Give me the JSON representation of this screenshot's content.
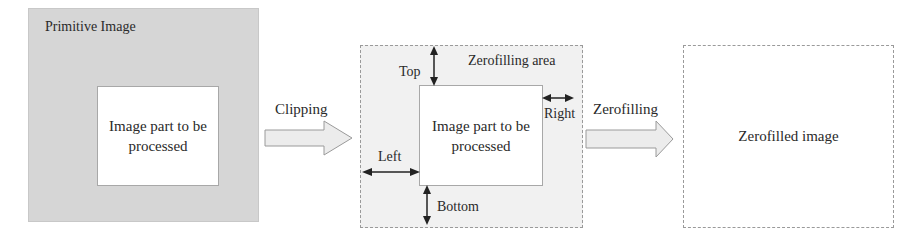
{
  "panels": {
    "primitive": {
      "title": "Primitive Image",
      "inner_label": "Image part to be processed"
    },
    "zerofilling": {
      "area_label": "Zerofilling area",
      "inner_label": "Image part to be processed",
      "margins": {
        "top": "Top",
        "left": "Left",
        "bottom": "Bottom",
        "right": "Right"
      }
    },
    "result": {
      "label": "Zerofilled image"
    }
  },
  "steps": [
    {
      "label": "Clipping"
    },
    {
      "label": "Zerofilling"
    }
  ],
  "colors": {
    "primitive_bg": "#d6d6d6",
    "zerofill_bg": "#f1f1f1",
    "arrow_fill": "#ececec",
    "line": "#222222"
  }
}
